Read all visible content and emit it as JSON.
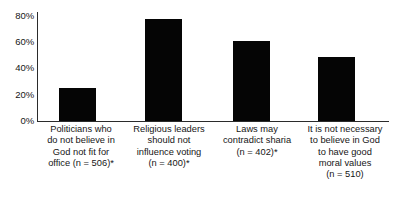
{
  "chart_data": {
    "type": "bar",
    "title": "",
    "subtitle": "",
    "xlabel": "",
    "ylabel": "",
    "ylim": [
      0,
      80
    ],
    "grid": false,
    "legend": false,
    "orientation": "vertical",
    "bar_color": "#050505",
    "axis_color": "#2b2b2b",
    "background": "#ffffff",
    "ytick_labels": [
      "80%",
      "60%",
      "40%",
      "20%",
      "0%"
    ],
    "ytick_values": [
      80,
      60,
      40,
      20,
      0
    ],
    "categories": [
      "Politicians who do not believe in God not fit for office (n = 506)*",
      "Religious leaders should not influence voting (n = 400)*",
      "Laws may contradict sharia (n = 402)*",
      "It is not necessary to believe in God to have good moral values (n = 510)"
    ],
    "category_lines": [
      [
        "Politicians who",
        "do not believe in",
        "God not fit for",
        "office (n = 506)*"
      ],
      [
        "Religious leaders",
        "should not",
        "influence voting",
        "(n = 400)*"
      ],
      [
        "Laws may",
        "contradict sharia",
        "(n = 402)*"
      ],
      [
        "It is not necessary",
        "to believe in God",
        "to have good",
        "moral values",
        "(n = 510)"
      ]
    ],
    "values": [
      25,
      78,
      61,
      49
    ],
    "sample_sizes": [
      506,
      400,
      402,
      510
    ],
    "footnote_marker": "*"
  },
  "yticks": {
    "t80": "80%",
    "t60": "60%",
    "t40": "40%",
    "t20": "20%",
    "t0": "0%"
  },
  "labels": {
    "cat0": {
      "l0": "Politicians who",
      "l1": "do not believe in",
      "l2": "God not fit for",
      "l3": "office (n = 506)*"
    },
    "cat1": {
      "l0": "Religious leaders",
      "l1": "should not",
      "l2": "influence voting",
      "l3": "(n = 400)*"
    },
    "cat2": {
      "l0": "Laws may",
      "l1": "contradict sharia",
      "l2": "(n = 402)*"
    },
    "cat3": {
      "l0": "It is not necessary",
      "l1": "to believe in God",
      "l2": "to have good",
      "l3": "moral values",
      "l4": "(n = 510)"
    }
  }
}
